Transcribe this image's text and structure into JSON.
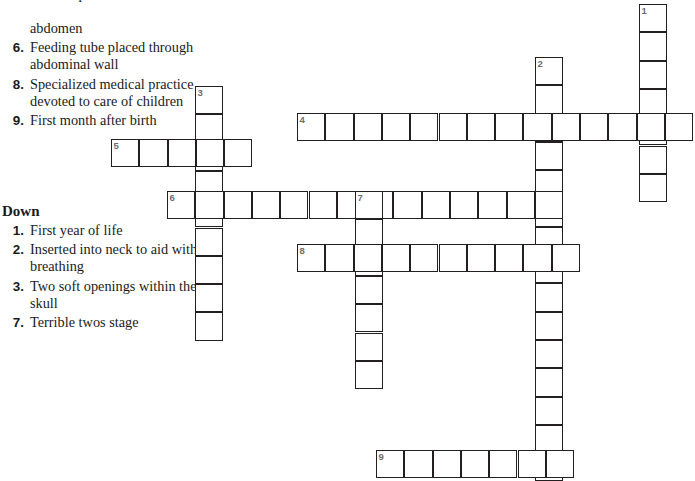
{
  "puzzle": {
    "type": "crossword",
    "cell_size": 28.3,
    "grid_origin": {
      "x": 111,
      "y": 4
    },
    "across_heading": "Across",
    "down_heading": "Down",
    "across_clues": [
      {
        "num": "",
        "text": "cerebrospinal fluid to",
        "clipped": true
      },
      {
        "num": "",
        "text": "abdomen",
        "continuation": true
      },
      {
        "num": "6",
        "text": "Feeding tube placed through abdominal wall"
      },
      {
        "num": "8",
        "text": "Specialized medical practice devoted to care of children"
      },
      {
        "num": "9",
        "text": "First month after birth"
      }
    ],
    "down_clues": [
      {
        "num": "1",
        "text": "First year of life"
      },
      {
        "num": "2",
        "text": "Inserted into neck to aid with breathing"
      },
      {
        "num": "3",
        "text": "Two soft openings within the skull"
      },
      {
        "num": "7",
        "text": "Terrible twos stage"
      }
    ],
    "entries": [
      {
        "num": "1",
        "dir": "down",
        "x": 639,
        "y": 4,
        "length": 7
      },
      {
        "num": "2",
        "dir": "down",
        "x": 535,
        "y": 57,
        "length": 15
      },
      {
        "num": "3",
        "dir": "down",
        "x": 195,
        "y": 86,
        "length": 9
      },
      {
        "num": "4",
        "dir": "across",
        "x": 297,
        "y": 113,
        "length": 14
      },
      {
        "num": "5",
        "dir": "across",
        "x": 111,
        "y": 139,
        "length": 5
      },
      {
        "num": "6",
        "dir": "across",
        "x": 167,
        "y": 191,
        "length": 14
      },
      {
        "num": "7",
        "dir": "down",
        "x": 355,
        "y": 191,
        "length": 7
      },
      {
        "num": "8",
        "dir": "across",
        "x": 297,
        "y": 244,
        "length": 10
      },
      {
        "num": "9",
        "dir": "across",
        "x": 376,
        "y": 450,
        "length": 7
      }
    ],
    "colors": {
      "cell_border": "#231f20",
      "cell_fill": "#ffffff",
      "clue_number": "#6d6d6d",
      "text": "#1b1b1b",
      "page_background": "#ffffff"
    }
  }
}
